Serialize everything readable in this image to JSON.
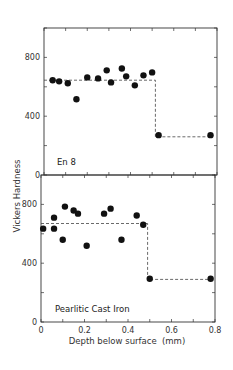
{
  "chart_data": {
    "type": "scatter",
    "shared_ylabel": "Vickers Hardness",
    "shared_xlabel": "Depth below surface  (mm)",
    "xlim": [
      0,
      0.8
    ],
    "x_ticks": [
      0,
      0.2,
      0.4,
      0.6,
      0.8
    ],
    "x_tick_labels": [
      "0",
      "0.2",
      "0.4",
      "0.6",
      "0.8"
    ],
    "grid": false,
    "legend": "none",
    "panels": [
      {
        "label": "En 8",
        "ylim": [
          0,
          1000
        ],
        "y_ticks": [
          0,
          400,
          800
        ],
        "y_tick_labels": [
          "0",
          "400",
          "800"
        ],
        "points": [
          [
            0.04,
            645
          ],
          [
            0.07,
            637
          ],
          [
            0.11,
            624
          ],
          [
            0.15,
            515
          ],
          [
            0.2,
            664
          ],
          [
            0.25,
            657
          ],
          [
            0.29,
            712
          ],
          [
            0.31,
            630
          ],
          [
            0.36,
            725
          ],
          [
            0.38,
            671
          ],
          [
            0.42,
            610
          ],
          [
            0.46,
            678
          ],
          [
            0.5,
            698
          ],
          [
            0.53,
            271
          ],
          [
            0.77,
            271
          ]
        ],
        "step_line": [
          [
            0,
            645
          ],
          [
            0.515,
            645
          ],
          [
            0.515,
            260
          ],
          [
            0.78,
            260
          ]
        ]
      },
      {
        "label": "Pearlitic Cast Iron",
        "ylim": [
          0,
          1000
        ],
        "y_ticks": [
          0,
          400,
          800
        ],
        "y_tick_labels": [
          "0",
          "400",
          "800"
        ],
        "points": [
          [
            0.01,
            635
          ],
          [
            0.06,
            635
          ],
          [
            0.06,
            710
          ],
          [
            0.1,
            560
          ],
          [
            0.11,
            785
          ],
          [
            0.15,
            758
          ],
          [
            0.17,
            737
          ],
          [
            0.21,
            519
          ],
          [
            0.29,
            737
          ],
          [
            0.32,
            771
          ],
          [
            0.37,
            560
          ],
          [
            0.44,
            724
          ],
          [
            0.47,
            662
          ],
          [
            0.5,
            294
          ],
          [
            0.78,
            294
          ]
        ],
        "step_line": [
          [
            0,
            670
          ],
          [
            0.49,
            670
          ],
          [
            0.49,
            290
          ],
          [
            0.78,
            290
          ]
        ]
      }
    ]
  }
}
